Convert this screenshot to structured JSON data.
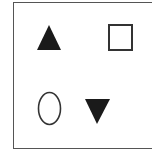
{
  "diagram": {
    "colors": {
      "fill": "#1a1a1a",
      "stroke": "#333333",
      "frame": "#555555",
      "background": "#ffffff"
    },
    "shapes": [
      {
        "id": "triangle-up",
        "type": "triangle",
        "orientation": "up",
        "filled": true,
        "points": "49,25 61,50 37,50"
      },
      {
        "id": "square",
        "type": "square",
        "filled": false,
        "x": 109,
        "y": 25,
        "width": 23,
        "height": 25
      },
      {
        "id": "ellipse",
        "type": "ellipse",
        "filled": false,
        "cx": 49.5,
        "cy": 108.5,
        "rx": 11,
        "ry": 16
      },
      {
        "id": "triangle-down",
        "type": "triangle",
        "orientation": "down",
        "filled": true,
        "points": "85,99 110,99 97,124"
      }
    ]
  }
}
